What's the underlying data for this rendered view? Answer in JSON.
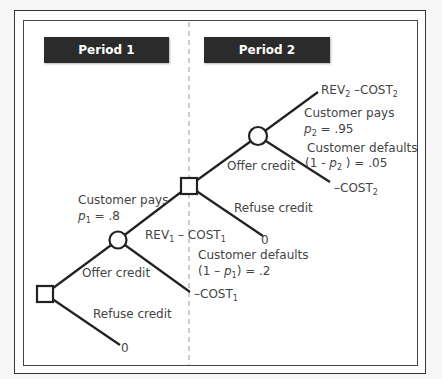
{
  "periods": [
    {
      "label": "Period 1"
    },
    {
      "label": "Period 2"
    }
  ],
  "tree": {
    "decision1": {
      "offer_label": "Offer credit",
      "refuse_label": "Refuse credit",
      "refuse_payoff": "0"
    },
    "chance1": {
      "pays_label": "Customer pays",
      "pays_prob_var": "p",
      "pays_prob_sub": "1",
      "pays_prob_value": " = .8",
      "pays_payoff_main": "REV",
      "pays_payoff_sub": "1",
      "pays_payoff_minus": " – COST",
      "pays_payoff_sub2": "1",
      "defaults_label": "Customer defaults",
      "defaults_prob_prefix": "(1 – ",
      "defaults_prob_var": "p",
      "defaults_prob_sub": "1",
      "defaults_prob_value": ") = .2",
      "defaults_payoff_main": "–COST",
      "defaults_payoff_sub": "1"
    },
    "decision2": {
      "offer_label": "Offer credit",
      "refuse_label": "Refuse credit",
      "refuse_payoff": "0"
    },
    "chance2": {
      "pays_label": "Customer pays",
      "pays_prob_var": "p",
      "pays_prob_sub": "2",
      "pays_prob_value": " = .95",
      "pays_payoff_main": "REV",
      "pays_payoff_sub": "2",
      "pays_payoff_minus": " –COST",
      "pays_payoff_sub2": "2",
      "defaults_label": "Customer defaults",
      "defaults_prob_prefix": "(1 - ",
      "defaults_prob_var": "p",
      "defaults_prob_sub": "2",
      "defaults_prob_value": " ) = .05",
      "defaults_payoff_main": "–COST",
      "defaults_payoff_sub": "2"
    }
  }
}
